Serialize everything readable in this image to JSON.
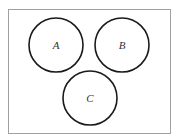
{
  "diagram": {
    "type": "venn",
    "universe": {
      "x": 8,
      "y": 9,
      "width": 162,
      "height": 124,
      "stroke": "#a0a0a0"
    },
    "sets": [
      {
        "label": "A",
        "cx": 56,
        "cy": 45,
        "r": 27
      },
      {
        "label": "B",
        "cx": 122,
        "cy": 45,
        "r": 27
      },
      {
        "label": "C",
        "cx": 90,
        "cy": 98,
        "r": 27
      }
    ],
    "circle_stroke": "#1a1a1a"
  }
}
